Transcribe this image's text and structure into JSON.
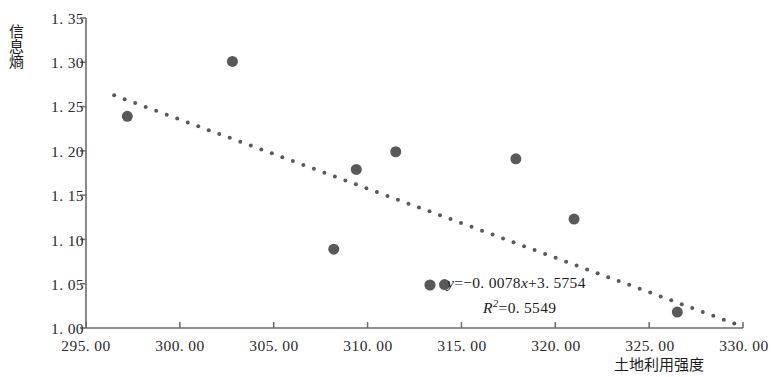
{
  "chart_data": {
    "type": "scatter",
    "title": "",
    "xlabel": "土地利用强度",
    "ylabel": "信息熵",
    "xlim": [
      295.0,
      330.0
    ],
    "ylim": [
      1.0,
      1.35
    ],
    "xticks": [
      "295. 00",
      "300. 00",
      "305. 00",
      "310. 00",
      "315. 00",
      "320. 00",
      "325. 00",
      "330. 00"
    ],
    "xtick_values": [
      295,
      300,
      305,
      310,
      315,
      320,
      325,
      330
    ],
    "yticks": [
      "1. 00",
      "1. 05",
      "1. 10",
      "1. 15",
      "1. 20",
      "1. 25",
      "1. 30",
      "1. 35"
    ],
    "ytick_values": [
      1.0,
      1.05,
      1.1,
      1.15,
      1.2,
      1.25,
      1.3,
      1.35
    ],
    "grid": false,
    "legend": "none",
    "marker_color": "#595959",
    "marker_size": 11,
    "trendline_color": "#595959",
    "trendline_style": "dotted",
    "axis_color": "#6b6b6b",
    "points": [
      {
        "x": 297.2,
        "y": 1.239
      },
      {
        "x": 302.8,
        "y": 1.301
      },
      {
        "x": 308.2,
        "y": 1.089
      },
      {
        "x": 309.4,
        "y": 1.179
      },
      {
        "x": 311.5,
        "y": 1.199
      },
      {
        "x": 314.1,
        "y": 1.049
      },
      {
        "x": 317.9,
        "y": 1.191
      },
      {
        "x": 321.0,
        "y": 1.123
      },
      {
        "x": 326.5,
        "y": 1.018
      }
    ],
    "series": [
      {
        "name": "信息熵",
        "x": [
          297.2,
          302.8,
          308.2,
          309.4,
          311.5,
          314.1,
          317.9,
          321.0,
          326.5
        ],
        "values": [
          1.239,
          1.301,
          1.089,
          1.179,
          1.199,
          1.049,
          1.191,
          1.123,
          1.018
        ]
      }
    ],
    "trendline": {
      "slope": -0.0078,
      "intercept": 3.5754,
      "r_squared": 0.5549,
      "x_start": 296.5,
      "x_end": 330.0
    },
    "annotations": {
      "equation": "y=−0. 0078x+3. 5754",
      "equation_lhs": "y",
      "equation_rhs": "=−0. 0078",
      "equation_var": "x",
      "equation_tail": "+3. 5754",
      "r2_symbol": "R",
      "r2_exponent": "2",
      "r2_value": "=0. 5549"
    }
  }
}
